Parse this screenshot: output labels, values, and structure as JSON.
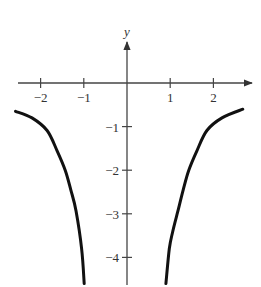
{
  "chart_data": {
    "type": "line",
    "title": "",
    "xlabel": "",
    "ylabel": "y",
    "xlim": [
      -2.6,
      2.9
    ],
    "ylim": [
      -4.6,
      1.2
    ],
    "grid": false,
    "legend": null,
    "x_ticks": [
      {
        "value": -2,
        "label": "−2"
      },
      {
        "value": -1,
        "label": "−1"
      },
      {
        "value": 1,
        "label": "1"
      },
      {
        "value": 2,
        "label": "2"
      }
    ],
    "y_ticks": [
      {
        "value": -1,
        "label": "−1"
      },
      {
        "value": -2,
        "label": "−2"
      },
      {
        "value": -3,
        "label": "−3"
      },
      {
        "value": -4,
        "label": "−4"
      }
    ],
    "series": [
      {
        "name": "left branch",
        "x": [
          -2.58,
          -2.2,
          -1.85,
          -1.62,
          -1.43,
          -1.3,
          -1.18,
          -1.05,
          -0.99
        ],
        "y": [
          -0.65,
          -0.8,
          -1.09,
          -1.55,
          -2.0,
          -2.45,
          -2.93,
          -3.8,
          -4.6
        ]
      },
      {
        "name": "right branch",
        "x": [
          0.9,
          0.98,
          1.06,
          1.18,
          1.3,
          1.43,
          1.62,
          1.85,
          2.2,
          2.68
        ],
        "y": [
          -4.6,
          -3.8,
          -3.4,
          -2.93,
          -2.45,
          -2.0,
          -1.55,
          -1.09,
          -0.8,
          -0.6
        ]
      }
    ],
    "colors": {
      "curve": "#111111",
      "axis": "#444444",
      "text": "#333333"
    }
  }
}
